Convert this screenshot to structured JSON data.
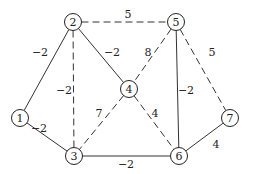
{
  "graph": {
    "nodes": [
      {
        "id": "1",
        "label": "1",
        "x": 20,
        "y": 118
      },
      {
        "id": "2",
        "label": "2",
        "x": 73,
        "y": 22
      },
      {
        "id": "3",
        "label": "3",
        "x": 74,
        "y": 156
      },
      {
        "id": "4",
        "label": "4",
        "x": 129,
        "y": 89
      },
      {
        "id": "5",
        "label": "5",
        "x": 176,
        "y": 22
      },
      {
        "id": "6",
        "label": "6",
        "x": 179,
        "y": 156
      },
      {
        "id": "7",
        "label": "7",
        "x": 230,
        "y": 118
      }
    ],
    "edges": [
      {
        "from": "1",
        "to": "2",
        "weight": "-2",
        "style": "solid",
        "lx": 40,
        "ly": 52
      },
      {
        "from": "1",
        "to": "3",
        "weight": "-2",
        "style": "solid",
        "lx": 39,
        "ly": 128
      },
      {
        "from": "2",
        "to": "5",
        "weight": "5",
        "style": "dashed",
        "lx": 128,
        "ly": 14
      },
      {
        "from": "2",
        "to": "4",
        "weight": "-2",
        "style": "solid",
        "lx": 112,
        "ly": 52
      },
      {
        "from": "2",
        "to": "3",
        "weight": "-2",
        "style": "dashed",
        "lx": 64,
        "ly": 90
      },
      {
        "from": "5",
        "to": "4",
        "weight": "8",
        "style": "dashed",
        "lx": 148,
        "ly": 52
      },
      {
        "from": "5",
        "to": "6",
        "weight": "-2",
        "style": "solid",
        "lx": 186,
        "ly": 90
      },
      {
        "from": "5",
        "to": "7",
        "weight": "5",
        "style": "dashed",
        "lx": 212,
        "ly": 52
      },
      {
        "from": "4",
        "to": "3",
        "weight": "7",
        "style": "dashed",
        "lx": 99,
        "ly": 113
      },
      {
        "from": "4",
        "to": "6",
        "weight": "4",
        "style": "dashed",
        "lx": 155,
        "ly": 113
      },
      {
        "from": "3",
        "to": "6",
        "weight": "-2",
        "style": "solid",
        "lx": 126,
        "ly": 164
      },
      {
        "from": "7",
        "to": "6",
        "weight": "4",
        "style": "solid",
        "lx": 216,
        "ly": 144
      }
    ]
  }
}
